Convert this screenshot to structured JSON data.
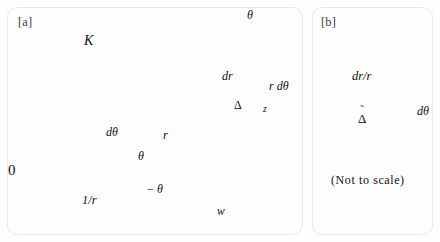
{
  "figure": {
    "panels": [
      {
        "id": "a",
        "label": "[a]",
        "labels": {
          "curve_K": "K",
          "theta_top": "θ",
          "dr": "dr",
          "r_dtheta": "r dθ",
          "delta": "Δ",
          "z_point": "z",
          "origin": "0",
          "dtheta": "dθ",
          "r": "r",
          "theta": "θ",
          "minus_theta": "− θ",
          "one_over_r": "1/r",
          "w_point": "w"
        }
      },
      {
        "id": "b",
        "label": "[b]",
        "labels": {
          "dr_over_r": "dr/r",
          "dtheta": "dθ",
          "delta_tilde_base": "Δ",
          "delta_tilde_accent": "˜",
          "note": "(Not to scale)"
        }
      }
    ],
    "colors": {
      "background": "#fefefe",
      "panel_border": "#e9e9ec",
      "gridline": "#e4e4e8",
      "thin_line": "#7a7a7a",
      "thick_line": "#111111",
      "text": "#111111"
    }
  }
}
